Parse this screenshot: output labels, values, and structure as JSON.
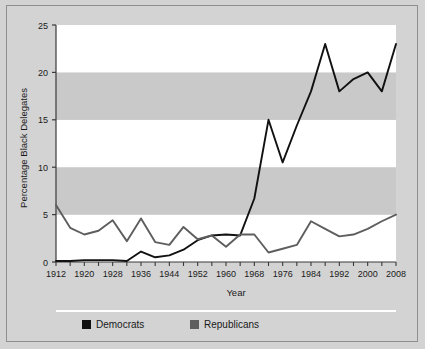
{
  "chart_data": {
    "type": "line",
    "title": "",
    "xlabel": "Year",
    "ylabel": "Percentage Black Delegates",
    "xlim": [
      1912,
      2008
    ],
    "ylim": [
      0,
      25
    ],
    "yticks": [
      0,
      5,
      10,
      15,
      20,
      25
    ],
    "ytick_labels": [
      "0",
      "5",
      "10",
      "15",
      "20",
      "25"
    ],
    "xticks": [
      1912,
      1916,
      1920,
      1924,
      1928,
      1932,
      1936,
      1940,
      1944,
      1948,
      1952,
      1956,
      1960,
      1964,
      1968,
      1972,
      1976,
      1980,
      1984,
      1988,
      1992,
      1996,
      2000,
      2004,
      2008
    ],
    "xtick_labels": [
      "1912",
      "1920",
      "1928",
      "1936",
      "1944",
      "1952",
      "1960",
      "1968",
      "1976",
      "1984",
      "1992",
      "2000",
      "2008"
    ],
    "xtick_label_years": [
      1912,
      1920,
      1928,
      1936,
      1944,
      1952,
      1960,
      1968,
      1976,
      1984,
      1992,
      2000,
      2008
    ],
    "grid": "horizontal-bands",
    "legend_position": "bottom",
    "x": [
      1912,
      1916,
      1920,
      1924,
      1928,
      1932,
      1936,
      1940,
      1944,
      1948,
      1952,
      1956,
      1960,
      1964,
      1968,
      1972,
      1976,
      1980,
      1984,
      1988,
      1992,
      1996,
      2000,
      2004,
      2008
    ],
    "series": [
      {
        "name": "Democrats",
        "color": "#111111",
        "values": [
          0.1,
          0.1,
          0.2,
          0.2,
          0.2,
          0.1,
          1.1,
          0.5,
          0.7,
          1.3,
          2.3,
          2.8,
          2.9,
          2.8,
          6.7,
          15.0,
          10.5,
          14.4,
          18.0,
          23.0,
          18.0,
          19.3,
          20.0,
          18.0,
          23.0
        ]
      },
      {
        "name": "Republicans",
        "color": "#5e5e5e",
        "values": [
          6.0,
          3.6,
          2.9,
          3.3,
          4.4,
          2.2,
          4.6,
          2.1,
          1.8,
          3.7,
          2.4,
          2.8,
          1.6,
          2.9,
          2.9,
          1.0,
          1.4,
          1.8,
          4.3,
          3.5,
          2.7,
          2.9,
          3.5,
          4.3,
          5.0
        ]
      }
    ]
  },
  "legend": {
    "items": [
      {
        "label": "Democrats",
        "color": "#111111"
      },
      {
        "label": "Republicans",
        "color": "#5e5e5e"
      }
    ]
  },
  "axes": {
    "y_title": "Percentage Black Delegates",
    "x_title": "Year"
  },
  "colors": {
    "background": "#d3d3d3",
    "plot_band_light": "#ffffff",
    "plot_band_dark": "#c9c9c9",
    "axis": "#3a3a3a",
    "border": "#8f8f8f",
    "separator": "#ffffff",
    "democrat": "#111111",
    "republican": "#5e5e5e"
  }
}
